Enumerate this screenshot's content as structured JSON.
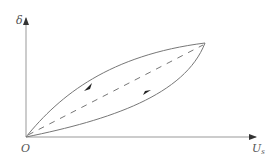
{
  "diagram": {
    "y_axis_label": "δ",
    "x_axis_label_main": "U",
    "x_axis_label_sub": "s",
    "origin_label": "O",
    "curves": [
      {
        "name": "upper-branch",
        "style": "solid",
        "direction": "down-left"
      },
      {
        "name": "lower-branch",
        "style": "solid",
        "direction": "up-right"
      },
      {
        "name": "mid-line",
        "style": "dashed"
      }
    ],
    "colors": {
      "stroke": "#777777",
      "axis": "#888888"
    }
  }
}
